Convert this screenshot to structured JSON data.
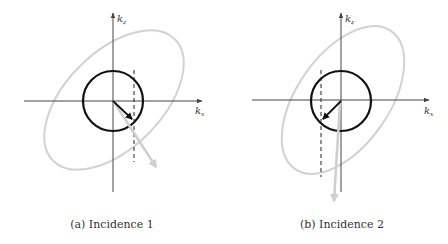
{
  "figure": {
    "panels": [
      {
        "id": "a",
        "caption": "(a)  Incidence 1",
        "axis_labels": {
          "vertical": "k",
          "vertical_sub": "z",
          "horizontal": "k",
          "horizontal_sub": "x"
        },
        "origin": [
          113,
          101
        ],
        "circle_radius": 30,
        "dashed_line_x": 134,
        "black_arrow_tip": [
          134,
          121
        ],
        "gray_arrow_tip": [
          158,
          170
        ],
        "ellipse": {
          "cx": 114,
          "cy": 100,
          "rx": 86,
          "ry": 48,
          "rotation_deg": -45
        }
      },
      {
        "id": "b",
        "caption": "(b)  Incidence 2",
        "axis_labels": {
          "vertical": "k",
          "vertical_sub": "z",
          "horizontal": "k",
          "horizontal_sub": "x"
        },
        "origin": [
          341,
          101
        ],
        "circle_radius": 30,
        "dashed_line_x": 321,
        "black_arrow_tip": [
          321,
          121
        ],
        "gray_arrow_tip": [
          335,
          205
        ],
        "ellipse": {
          "cx": 343,
          "cy": 100,
          "rx": 84,
          "ry": 46,
          "rotation_deg": -55
        }
      }
    ],
    "colors": {
      "axis": "#444444",
      "circle": "#111111",
      "ellipse": "#d2d2d2",
      "dashed": "#222222",
      "black_arrow": "#111111",
      "gray_arrow": "#cfcfcf"
    }
  }
}
